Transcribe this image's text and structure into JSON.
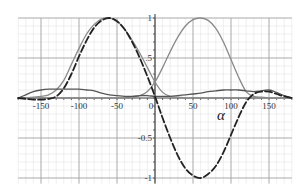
{
  "chart_data": {
    "type": "line",
    "title": "",
    "xlabel": "α",
    "ylabel": "",
    "xlim": [
      -180,
      180
    ],
    "ylim": [
      -1.07,
      1.0
    ],
    "grid": true,
    "legend": null,
    "x_ticks": [
      -150,
      -100,
      -50,
      0,
      50,
      100,
      150
    ],
    "x_tick_labels": [
      "-150",
      "-100",
      "-50",
      "0",
      "50",
      "100",
      "150"
    ],
    "y_ticks": [
      -1,
      -0.5,
      0.5,
      1
    ],
    "y_tick_labels": [
      "-1",
      "-0.5",
      ".5",
      "1"
    ],
    "x": [
      -180,
      -170,
      -160,
      -150,
      -140,
      -130,
      -120,
      -110,
      -100,
      -90,
      -80,
      -70,
      -60,
      -50,
      -40,
      -30,
      -20,
      -10,
      0,
      10,
      20,
      30,
      40,
      50,
      60,
      70,
      80,
      90,
      100,
      110,
      120,
      130,
      140,
      150,
      160,
      170,
      180
    ],
    "series": [
      {
        "name": "dashed-black",
        "style": "dashed",
        "color": "#222222",
        "values": [
          0,
          -0.01,
          -0.02,
          -0.02,
          -0.01,
          0.02,
          0.12,
          0.3,
          0.52,
          0.72,
          0.88,
          0.97,
          1.0,
          0.96,
          0.86,
          0.7,
          0.5,
          0.27,
          0.02,
          -0.25,
          -0.5,
          -0.72,
          -0.88,
          -0.97,
          -1.0,
          -0.95,
          -0.85,
          -0.68,
          -0.46,
          -0.24,
          -0.05,
          0.05,
          0.08,
          0.08,
          0.05,
          0.02,
          0
        ]
      },
      {
        "name": "gray-left-peak",
        "style": "solid",
        "color": "#8a8a8a",
        "values": [
          0,
          0,
          0.01,
          0.02,
          0.04,
          0.1,
          0.22,
          0.42,
          0.62,
          0.8,
          0.92,
          0.99,
          1.0,
          0.96,
          0.86,
          0.72,
          0.56,
          0.38,
          0.2,
          0.07,
          0.02,
          0.01,
          0,
          0,
          0,
          0,
          0,
          0,
          0,
          0,
          0,
          0,
          0,
          0,
          0,
          0,
          0
        ]
      },
      {
        "name": "gray-right-peak",
        "style": "solid",
        "color": "#8a8a8a",
        "values": [
          0,
          0,
          0,
          0,
          0,
          0,
          0,
          0,
          0,
          0,
          0,
          0,
          0,
          0,
          0,
          0.01,
          0.03,
          0.08,
          0.2,
          0.38,
          0.58,
          0.76,
          0.9,
          0.98,
          1.0,
          0.97,
          0.87,
          0.7,
          0.48,
          0.26,
          0.08,
          0.02,
          0.01,
          0,
          0,
          0,
          0
        ]
      },
      {
        "name": "dark-solid-low",
        "style": "solid",
        "color": "#555555",
        "values": [
          0,
          0.04,
          0.08,
          0.1,
          0.11,
          0.11,
          0.11,
          0.11,
          0.11,
          0.1,
          0.09,
          0.06,
          0.04,
          0.03,
          0.02,
          0.02,
          0.03,
          0.03,
          0.02,
          0.02,
          0.02,
          0.03,
          0.04,
          0.05,
          0.06,
          0.08,
          0.09,
          0.1,
          0.1,
          0.1,
          0.09,
          0.08,
          0.09,
          0.1,
          0.07,
          0.03,
          0
        ]
      }
    ]
  }
}
